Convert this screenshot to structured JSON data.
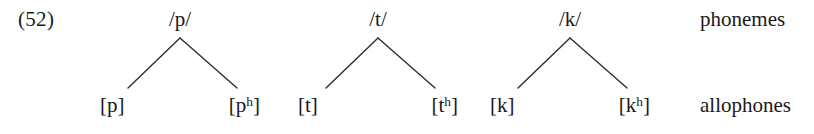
{
  "diagram": {
    "example_number": "(52)",
    "type": "phoneme-allophone-tree",
    "row_labels": {
      "top": "phonemes",
      "bottom": "allophones"
    },
    "trees": [
      {
        "id": "tree-p",
        "phoneme": "/p/",
        "allophone_left": "[p]",
        "allophone_right_base": "[p",
        "allophone_right_sup": "h",
        "allophone_right_close": "]"
      },
      {
        "id": "tree-t",
        "phoneme": "/t/",
        "allophone_left": "[t]",
        "allophone_right_base": "[t",
        "allophone_right_sup": "h",
        "allophone_right_close": "]"
      },
      {
        "id": "tree-k",
        "phoneme": "/k/",
        "allophone_left": "[k]",
        "allophone_right_base": "[k",
        "allophone_right_sup": "h",
        "allophone_right_close": "]"
      }
    ],
    "colors": {
      "background": "#ffffff",
      "text": "#1a1a1a",
      "branch_line": "#2e2e2e"
    }
  }
}
